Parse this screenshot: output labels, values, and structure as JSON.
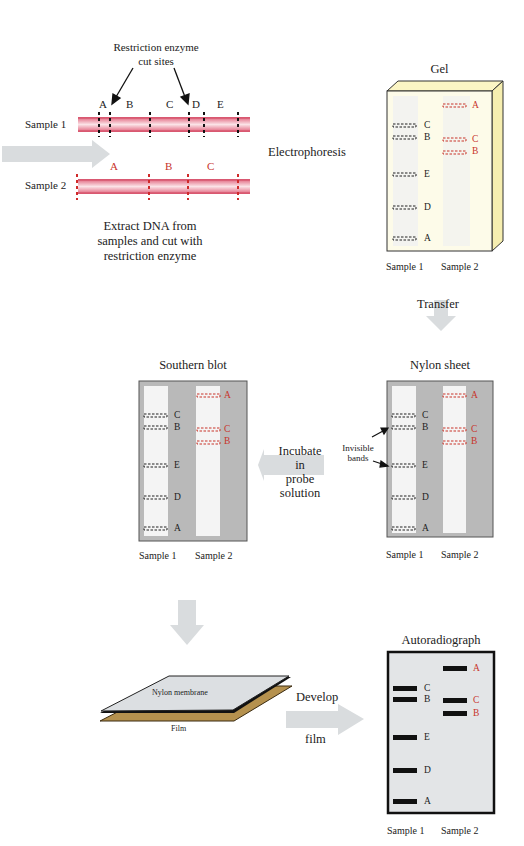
{
  "step1": {
    "callout": "Restriction enzyme\ncut sites",
    "callout_line1": "Restriction enzyme",
    "callout_line2": "cut sites",
    "sample1_label": "Sample 1",
    "sample2_label": "Sample 2",
    "sample1_fragments": [
      "A",
      "B",
      "C",
      "D",
      "E"
    ],
    "sample2_fragments": [
      "A",
      "B",
      "C"
    ],
    "caption_line1": "Extract DNA from",
    "caption_line2": "samples and cut with",
    "caption_line3": "restriction enzyme"
  },
  "arrows": {
    "electrophoresis": "Electrophoresis",
    "transfer": "Transfer",
    "incubate_line1": "Incubate",
    "incubate_line2": "in",
    "incubate_line3": "probe",
    "incubate_line4": "solution",
    "develop_line1": "Develop",
    "develop_line2": "film"
  },
  "gel": {
    "title": "Gel",
    "lane1_label": "Sample 1",
    "lane2_label": "Sample 2",
    "lane1_bands": [
      "C",
      "B",
      "E",
      "D",
      "A"
    ],
    "lane2_bands": [
      "A",
      "C",
      "B"
    ]
  },
  "nylon_sheet": {
    "title": "Nylon sheet",
    "annotation_line1": "Invisible",
    "annotation_line2": "bands",
    "lane1_label": "Sample 1",
    "lane2_label": "Sample 2",
    "lane1_bands": [
      "C",
      "B",
      "E",
      "D",
      "A"
    ],
    "lane2_bands": [
      "A",
      "C",
      "B"
    ]
  },
  "southern_blot": {
    "title": "Southern blot",
    "lane1_label": "Sample 1",
    "lane2_label": "Sample 2",
    "lane1_bands": [
      "C",
      "B",
      "E",
      "D",
      "A"
    ],
    "lane2_bands": [
      "A",
      "C",
      "B"
    ]
  },
  "membrane_stack": {
    "membrane_label": "Nylon membrane",
    "film_label": "Film"
  },
  "autoradiograph": {
    "title": "Autoradiograph",
    "lane1_label": "Sample 1",
    "lane2_label": "Sample 2",
    "lane1_bands": [
      "C",
      "B",
      "E",
      "D",
      "A"
    ],
    "lane2_bands": [
      "A",
      "C",
      "B"
    ]
  },
  "colors": {
    "dna_pink": "#e8788a",
    "sample2_red": "#c8342b",
    "arrow_gray": "#d9dcde",
    "gel_yellow": "#fdf9d8",
    "sheet_gray": "#b9b9b9",
    "film_tan": "#b5914e",
    "autorad_bg": "#e3e5e7"
  }
}
